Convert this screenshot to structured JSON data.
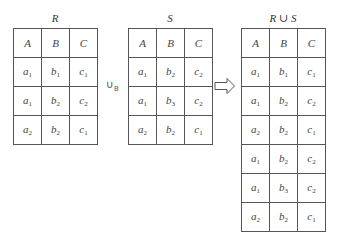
{
  "diagram": {
    "operator_label": "∪",
    "operator_subscript": "B",
    "arrow_icon": "hollow-right-arrow",
    "relations": [
      {
        "name": "R",
        "headers": [
          "A",
          "B",
          "C"
        ],
        "rows": [
          [
            {
              "v": "a",
              "s": "1"
            },
            {
              "v": "b",
              "s": "1"
            },
            {
              "v": "c",
              "s": "1"
            }
          ],
          [
            {
              "v": "a",
              "s": "1"
            },
            {
              "v": "b",
              "s": "2"
            },
            {
              "v": "c",
              "s": "2"
            }
          ],
          [
            {
              "v": "a",
              "s": "2"
            },
            {
              "v": "b",
              "s": "2"
            },
            {
              "v": "c",
              "s": "1"
            }
          ]
        ]
      },
      {
        "name": "S",
        "headers": [
          "A",
          "B",
          "C"
        ],
        "rows": [
          [
            {
              "v": "a",
              "s": "1"
            },
            {
              "v": "b",
              "s": "2"
            },
            {
              "v": "c",
              "s": "2"
            }
          ],
          [
            {
              "v": "a",
              "s": "1"
            },
            {
              "v": "b",
              "s": "3"
            },
            {
              "v": "c",
              "s": "2"
            }
          ],
          [
            {
              "v": "a",
              "s": "2"
            },
            {
              "v": "b",
              "s": "2"
            },
            {
              "v": "c",
              "s": "1"
            }
          ]
        ]
      },
      {
        "name": "R ∪ S",
        "headers": [
          "A",
          "B",
          "C"
        ],
        "rows": [
          [
            {
              "v": "a",
              "s": "1"
            },
            {
              "v": "b",
              "s": "1"
            },
            {
              "v": "c",
              "s": "1"
            }
          ],
          [
            {
              "v": "a",
              "s": "1"
            },
            {
              "v": "b",
              "s": "2"
            },
            {
              "v": "c",
              "s": "2"
            }
          ],
          [
            {
              "v": "a",
              "s": "2"
            },
            {
              "v": "b",
              "s": "2"
            },
            {
              "v": "c",
              "s": "1"
            }
          ],
          [
            {
              "v": "a",
              "s": "1"
            },
            {
              "v": "b",
              "s": "2"
            },
            {
              "v": "c",
              "s": "2"
            }
          ],
          [
            {
              "v": "a",
              "s": "1"
            },
            {
              "v": "b",
              "s": "3"
            },
            {
              "v": "c",
              "s": "2"
            }
          ],
          [
            {
              "v": "a",
              "s": "2"
            },
            {
              "v": "b",
              "s": "2"
            },
            {
              "v": "c",
              "s": "1"
            }
          ]
        ]
      }
    ]
  }
}
